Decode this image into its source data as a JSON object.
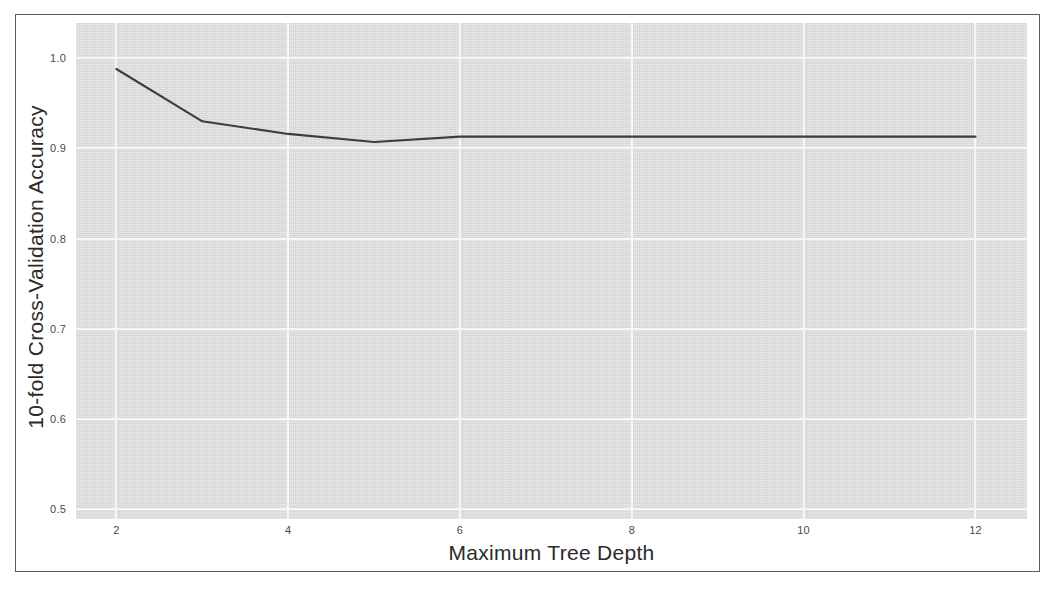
{
  "chart_data": {
    "type": "line",
    "title": "",
    "xlabel": "Maximum Tree Depth",
    "ylabel": "10-fold Cross-Validation Accuracy",
    "x": [
      2,
      3,
      4,
      5,
      6,
      7,
      8,
      9,
      10,
      11,
      12
    ],
    "values": [
      0.988,
      0.93,
      0.916,
      0.907,
      0.913,
      0.913,
      0.913,
      0.913,
      0.913,
      0.913,
      0.913
    ],
    "series": [
      {
        "name": "cv-accuracy",
        "values": [
          0.988,
          0.93,
          0.916,
          0.907,
          0.913,
          0.913,
          0.913,
          0.913,
          0.913,
          0.913,
          0.913
        ]
      }
    ],
    "xlim": [
      1.53,
      12.6
    ],
    "ylim": [
      0.489,
      1.039
    ],
    "xticks": [
      2,
      4,
      6,
      8,
      10,
      12
    ],
    "xtick_labels": [
      "2",
      "4",
      "6",
      "8",
      "10",
      "12"
    ],
    "yticks": [
      0.5,
      0.6,
      0.7,
      0.8,
      0.9,
      1.0
    ],
    "ytick_labels": [
      "0.5",
      "0.6",
      "0.7",
      "0.8",
      "0.9",
      "1.0"
    ],
    "grid": true,
    "grid_color": "#f7f7f7",
    "panel_background": "#d3d3d3",
    "line_color": "#3d3d3d",
    "line_width": 2,
    "legend": null,
    "legend_position": "none",
    "annotations": []
  },
  "figure": {
    "background": "#ffffff",
    "border_color": "#5d5d5d"
  }
}
